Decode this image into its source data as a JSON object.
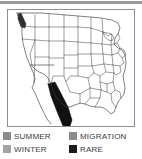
{
  "figure": {
    "kind": "range-map",
    "background_color": "#ffffff",
    "top_rule_color": "#9a9a9d"
  },
  "map": {
    "region": "continental-united-states",
    "border_color": "#8e8e91",
    "state_line_color": "#4d4d4f",
    "coast_line_color": "#3c3c3e",
    "fill_color": "#ffffff",
    "shaded_ranges": [
      {
        "name": "southwest-band",
        "color": "#111111",
        "description": "dark band across southern california, arizona and northwest mexico"
      },
      {
        "name": "washington-coast-patch",
        "color": "#2e2e30",
        "description": "small dark patch on the northwest pacific coast"
      }
    ]
  },
  "legend": {
    "rows": [
      {
        "items": [
          {
            "label": "SUMMER",
            "color": "#8c8c8f"
          },
          {
            "label": "MIGRATION",
            "color": "#8c8c8f"
          }
        ]
      },
      {
        "items": [
          {
            "label": "WINTER",
            "color": "#a3a3a6"
          },
          {
            "label": "RARE",
            "color": "#1a1a1a"
          }
        ]
      }
    ]
  }
}
